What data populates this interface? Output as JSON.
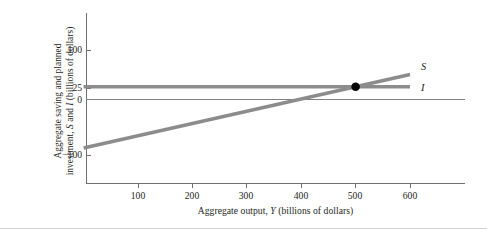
{
  "chart_data": {
    "type": "line",
    "title": "",
    "xlabel": "Aggregate output, Y (billions of dollars)",
    "ylabel": "Aggregate saving and planned investment, S and I (billions of dollars)",
    "ylabel_line1": "Aggregate saving and planned",
    "ylabel_line2_pre": "investment, ",
    "ylabel_line2_s": "S",
    "ylabel_line2_mid": " and ",
    "ylabel_line2_i": "I",
    "ylabel_line2_post": " (billions of dollars)",
    "xlabel_pre": "Aggregate output, ",
    "xlabel_var": "Y",
    "xlabel_post": " (billions of dollars)",
    "xlim": [
      0,
      660
    ],
    "ylim": [
      -140,
      120
    ],
    "x_ticks": [
      100,
      200,
      300,
      400,
      500,
      600
    ],
    "x_tick_labels": [
      "100",
      "200",
      "300",
      "400",
      "500",
      "600"
    ],
    "y_ticks": [
      100,
      25,
      0,
      -100
    ],
    "y_tick_labels": [
      "100",
      "25",
      "0",
      "−100"
    ],
    "grid": false,
    "legend": "inline-right",
    "series": [
      {
        "name": "S",
        "label": "S",
        "color": "#8c8c8c",
        "type": "line",
        "x": [
          0,
          600
        ],
        "values": [
          -100,
          50
        ],
        "slope": 0.25,
        "intercept": -100
      },
      {
        "name": "I",
        "label": "I",
        "color": "#8c8c8c",
        "type": "line",
        "x": [
          0,
          600
        ],
        "values": [
          25,
          25
        ],
        "slope": 0,
        "intercept": 25
      }
    ],
    "annotations": [
      {
        "name": "equilibrium-point",
        "type": "point",
        "x": 500,
        "y": 25,
        "color": "#000000"
      }
    ]
  },
  "labels": {
    "curve_s": "S",
    "curve_i": "I",
    "y_100": "100",
    "y_25": "25",
    "y_0": "0",
    "y_neg100": "−100",
    "x_100": "100",
    "x_200": "200",
    "x_300": "300",
    "x_400": "400",
    "x_500": "500",
    "x_600": "600"
  },
  "colors": {
    "curve": "#8c8c8c",
    "axis": "#6f6f6f",
    "zero_line": "#808080",
    "point": "#000000",
    "text": "#231f20",
    "bottom_rule": "#d3d3d3"
  }
}
